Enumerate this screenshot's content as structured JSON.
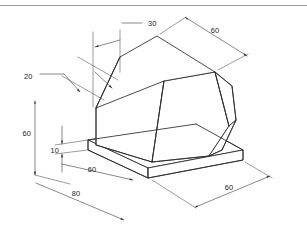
{
  "document": {
    "title": "Isometric dimensioned solid",
    "description": "Engineering isometric projection of a chamfered block resting on a thin base slab, annotated with linear dimensions.",
    "background_color": "#ffffff",
    "line_color": "#2b2b2b",
    "dimension_color": "#3a3a3a",
    "text_color": "#1a1a1a",
    "rule_color": "#9a9a9a"
  },
  "dimensions": {
    "top_width": {
      "label": "30",
      "name": "top-face-width",
      "text_x": 148,
      "text_y": 26,
      "orientation": "horizontal"
    },
    "top_right_depth": {
      "label": "60",
      "name": "top-right-depth",
      "text_x": 215,
      "text_y": 33,
      "orientation": "isometric-right"
    },
    "leader_20": {
      "label": "20",
      "name": "chamfer-offset",
      "text_x": 24,
      "text_y": 79,
      "orientation": "leader"
    },
    "left_height": {
      "label": "60",
      "name": "overall-height",
      "text_x": 35,
      "text_y": 133,
      "orientation": "vertical"
    },
    "base_thickness": {
      "label": "10",
      "name": "base-slab-thickness",
      "text_x": 62,
      "text_y": 152,
      "orientation": "vertical"
    },
    "bottom_left_depth": {
      "label": "60",
      "name": "base-left-depth",
      "text_x": 92,
      "text_y": 173,
      "orientation": "isometric-left"
    },
    "bottom_overall": {
      "label": "80",
      "name": "base-overall-length",
      "text_x": 76,
      "text_y": 195,
      "orientation": "isometric-left"
    },
    "bottom_right_depth": {
      "label": "60",
      "name": "base-right-depth",
      "text_x": 228,
      "text_y": 189,
      "orientation": "isometric-right"
    }
  },
  "geometry": {
    "top_face": "M 120,57 L 157,36 L 215,72 L 164,81 Z",
    "upper_right_face": "M 157,36 L 215,72 L 215,72",
    "front_left_face": "M 120,57 L 164,81 L 152,162 L 96,145 Z",
    "front_right_face": "M 164,81 L 215,72 L 229,126 L 209,156 L 152,162 Z",
    "right_side_face": "M 215,72 L 232,86 L 236,120 L 229,126 Z",
    "base_top": "M 88,140 L 148,168 L 243,150 L 196,124 Z",
    "base_front": "M 88,140 L 88,150 L 148,178 L 148,168 Z",
    "base_right": "M 148,168 L 148,178 L 243,160 L 243,150 Z"
  }
}
